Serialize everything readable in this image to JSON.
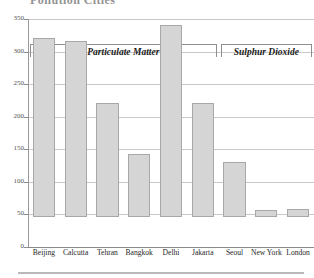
{
  "chart_data": {
    "type": "bar",
    "title": "Pollution Cities",
    "xlabel": "",
    "ylabel": "",
    "ylim": [
      0,
      350
    ],
    "yticks": [
      0,
      50,
      100,
      150,
      200,
      250,
      300,
      350
    ],
    "ytick_labels": [
      "0",
      "50",
      "100",
      "150",
      "200",
      "250",
      "300",
      "350"
    ],
    "grid": true,
    "legend_position": "top-inside-brackets",
    "categories": [
      "Beijing",
      "Calcutta",
      "Tehran",
      "Bangkok",
      "Delhi",
      "Jakarta",
      "Seoul",
      "New York",
      "London"
    ],
    "values": [
      275,
      270,
      175,
      97,
      295,
      175,
      85,
      11,
      12
    ],
    "groups": [
      {
        "label": "Particulate Matter",
        "categories": [
          "Beijing",
          "Calcutta",
          "Tehran",
          "Bangkok",
          "Delhi",
          "Jakarta"
        ]
      },
      {
        "label": "Sulphur Dioxide",
        "categories": [
          "Seoul",
          "New York",
          "London"
        ]
      }
    ],
    "bar_color": "#d5d5d5",
    "bar_border_color": "#a8a8a8",
    "gridline_color": "#c9c9c9",
    "axis_color": "#8a8a8a"
  }
}
